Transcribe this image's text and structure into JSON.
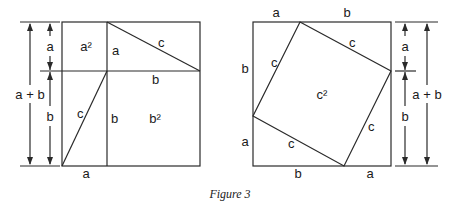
{
  "caption": "Figure 3",
  "left_figure": {
    "dimension_labels": {
      "outer": "a + b",
      "inner_top": "a",
      "inner_bottom": "b"
    },
    "region_labels": {
      "top_left_square": "a²",
      "bottom_right_square": "b²"
    },
    "edge_labels": {
      "top_divider": "a",
      "top_triangle_hyp": "c",
      "middle_b": "b",
      "lower_hyp": "c",
      "lower_divider": "b",
      "bottom": "a"
    }
  },
  "right_figure": {
    "top_labels": {
      "left": "a",
      "right": "b"
    },
    "bottom_labels": {
      "left": "b",
      "right": "a"
    },
    "left_labels": {
      "top": "b",
      "bottom": "a"
    },
    "inner_square_sides": [
      "c",
      "c",
      "c",
      "c"
    ],
    "inner_square_label": "c²",
    "dimension_labels": {
      "outer": "a + b",
      "inner_top": "a",
      "inner_bottom": "b"
    }
  }
}
